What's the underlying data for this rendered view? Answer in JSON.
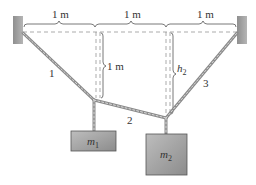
{
  "diagram": {
    "type": "physics-statics",
    "colors": {
      "wall": "#9a9a9a",
      "rope": "#8a8a8a",
      "rope_light": "#d8d8d8",
      "mass_fill": "#a8a8a8",
      "mass_border": "#555555",
      "dashed": "#888888",
      "text": "#333333"
    },
    "dimensions": {
      "span_1": "1 m",
      "span_2": "1 m",
      "span_3": "1 m",
      "vertical_1": "1 m",
      "vertical_2_var": "h",
      "vertical_2_sub": "2"
    },
    "ropes": [
      {
        "label": "1"
      },
      {
        "label": "2"
      },
      {
        "label": "3"
      }
    ],
    "masses": [
      {
        "var": "m",
        "sub": "1"
      },
      {
        "var": "m",
        "sub": "2"
      }
    ]
  }
}
